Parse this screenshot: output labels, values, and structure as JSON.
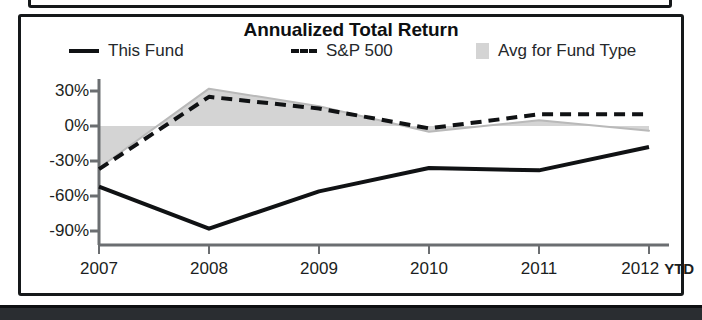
{
  "chart": {
    "title": "Annualized Total Return",
    "legend": [
      {
        "label": "This Fund",
        "marker": "solid-line-swatch"
      },
      {
        "label": "S&P 500",
        "marker": "dashed-line-swatch"
      },
      {
        "label": "Avg for Fund Type",
        "marker": "gray-band-swatch"
      }
    ],
    "y_axis_labels": [
      "30%",
      "0%",
      "-30%",
      "-60%",
      "-90%"
    ],
    "x_axis_labels": [
      "2007",
      "2008",
      "2009",
      "2010",
      "2011",
      "2012"
    ],
    "x_axis_suffix": "YTD"
  },
  "chart_data": {
    "type": "line",
    "title": "Annualized Total Return",
    "xlabel": "",
    "ylabel": "",
    "x": [
      "2007",
      "2008",
      "2009",
      "2010",
      "2011",
      "2012 YTD"
    ],
    "categories": [
      "2007",
      "2008",
      "2009",
      "2010",
      "2011",
      "2012 YTD"
    ],
    "ylim": [
      -90,
      30
    ],
    "yticks": [
      30,
      0,
      -30,
      -60,
      -90
    ],
    "ytick_labels": [
      "30%",
      "0%",
      "-30%",
      "-60%",
      "-90%"
    ],
    "grid": false,
    "legend_position": "top",
    "series": [
      {
        "name": "This Fund",
        "style": "solid",
        "color": "#101214",
        "values": [
          -52,
          -88,
          -56,
          -36,
          -38,
          -18
        ]
      },
      {
        "name": "S&P 500",
        "style": "dashed",
        "color": "#101214",
        "values": [
          -37,
          25,
          15,
          -2,
          10,
          10
        ]
      },
      {
        "name": "Avg for Fund Type",
        "style": "band",
        "color": "#d4d4d4",
        "values": [
          -36,
          32,
          17,
          -5,
          5,
          -4
        ],
        "band_baseline": [
          0,
          0,
          0,
          0,
          0,
          0
        ]
      }
    ]
  },
  "colors": {
    "line": "#101214",
    "band_fill": "#d4d4d4",
    "axis": "#6b6e71",
    "frame": "#15181a"
  }
}
